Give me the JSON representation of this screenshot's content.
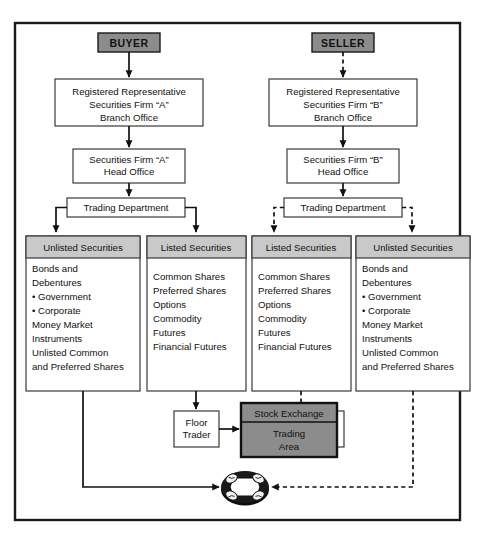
{
  "diagram": {
    "colors": {
      "frame_border": "#1a1a1a",
      "page_background": "#ffffff",
      "party_fill": "#8c8c8c",
      "section_header_fill": "#c9c9c9",
      "exchange_header_fill": "#8c8c8c",
      "exchange_body_fill": "#8c8c8c",
      "box_fill": "#ffffff",
      "line": "#111111",
      "text": "#111111"
    },
    "buyer_side": {
      "party": "BUYER",
      "branch_office": [
        "Registered Representative",
        "Securities Firm “A”",
        "Branch Office"
      ],
      "head_office": [
        "Securities Firm “A”",
        "Head Office"
      ],
      "trading_department": "Trading Department",
      "unlisted": {
        "header": "Unlisted Securities",
        "items": [
          "Bonds and",
          "Debentures",
          "• Government",
          "• Corporate",
          "Money Market",
          "Instruments",
          "Unlisted Common",
          "and Preferred Shares"
        ]
      },
      "listed": {
        "header": "Listed Securities",
        "items": [
          "Common Shares",
          "Preferred Shares",
          "Options",
          "Commodity",
          "Futures",
          "Financial Futures"
        ]
      },
      "floor_trader": [
        "Floor",
        "Trader"
      ]
    },
    "seller_side": {
      "party": "SELLER",
      "branch_office": [
        "Registered Representative",
        "Securities Firm “B”",
        "Branch Office"
      ],
      "head_office": [
        "Securities Firm “B”",
        "Head Office"
      ],
      "trading_department": "Trading Department",
      "listed": {
        "header": "Listed Securities",
        "items": [
          "Common Shares",
          "Preferred Shares",
          "Options",
          "Commodity",
          "Futures",
          "Financial Futures"
        ]
      },
      "unlisted": {
        "header": "Unlisted Securities",
        "items": [
          "Bonds and",
          "Debentures",
          "• Government",
          "• Corporate",
          "Money Market",
          "Instruments",
          "Unlisted Common",
          "and Preferred Shares"
        ]
      },
      "floor_trader": [
        "Floor",
        "Trader"
      ]
    },
    "exchange": {
      "header": "Stock Exchange",
      "body": [
        "Trading",
        "Area"
      ]
    },
    "otc": {
      "icon": "round-table-icon",
      "seats": 4
    }
  }
}
